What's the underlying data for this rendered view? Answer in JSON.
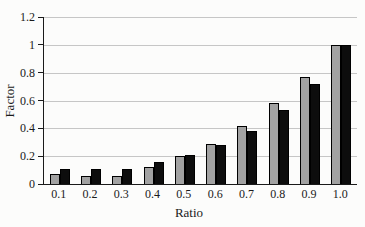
{
  "chart_data": {
    "type": "bar",
    "title": "",
    "xlabel": "Ratio",
    "ylabel": "Factor",
    "categories": [
      "0.1",
      "0.2",
      "0.3",
      "0.4",
      "0.5",
      "0.6",
      "0.7",
      "0.8",
      "0.9",
      "1.0"
    ],
    "series": [
      {
        "name": "gray-bars",
        "color": "#a2a2a2",
        "values": [
          0.07,
          0.06,
          0.06,
          0.12,
          0.2,
          0.29,
          0.42,
          0.58,
          0.77,
          1.0
        ]
      },
      {
        "name": "black-bars",
        "color": "#0d0d0d",
        "values": [
          0.11,
          0.11,
          0.11,
          0.16,
          0.21,
          0.28,
          0.38,
          0.53,
          0.72,
          1.0
        ]
      }
    ],
    "ylim": [
      0,
      1.2
    ],
    "yticks": [
      0,
      0.2,
      0.4,
      0.6,
      0.8,
      1.0,
      1.2
    ],
    "ytick_labels": [
      "0",
      "0.2",
      "0.4",
      "0.6",
      "0.8",
      "1",
      "1.2"
    ],
    "grid": true,
    "legend_position": "none"
  },
  "style": {
    "gridline_color": "#c6c6c6",
    "axis_color": "#1a1a1a",
    "background": "#fcfcfb"
  }
}
